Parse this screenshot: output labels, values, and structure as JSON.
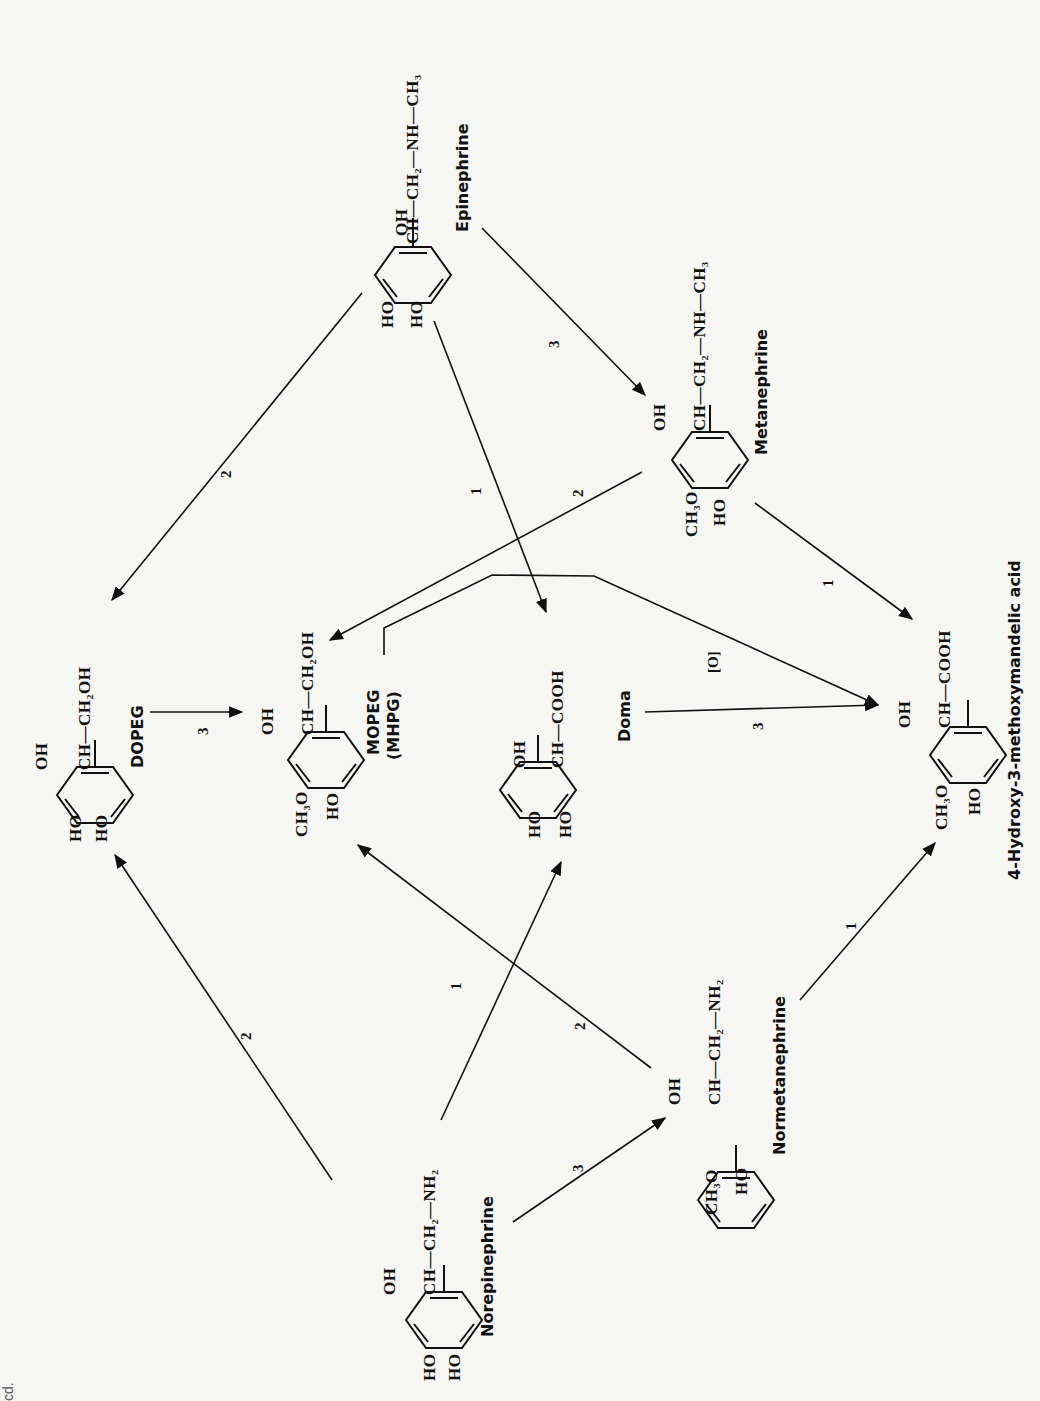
{
  "diagram": {
    "type": "metabolic-pathway",
    "orientation": "rotated-90-ccw",
    "compounds": {
      "epinephrine": {
        "name": "Epinephrine",
        "side_chain": "CH—CH₂—NH—CH₃",
        "oh": "OH",
        "ring_sub_1": "HO",
        "ring_sub_2": "HO"
      },
      "metanephrine": {
        "name": "Metanephrine",
        "side_chain": "CH—CH₂—NH—CH₃",
        "oh": "OH",
        "ring_sub_1": "CH₃O",
        "ring_sub_2": "HO"
      },
      "dopeg": {
        "name": "DOPEG",
        "side_chain": "CH—CH₂OH",
        "oh": "OH",
        "ring_sub_1": "HO",
        "ring_sub_2": "HO"
      },
      "mopeg": {
        "name": "MOPEG",
        "alt_name": "(MHPG)",
        "side_chain": "CH—CH₂OH",
        "oh": "OH",
        "ring_sub_1": "CH₃O",
        "ring_sub_2": "HO"
      },
      "doma": {
        "name": "Doma",
        "side_chain": "CH—COOH",
        "oh": "OH",
        "ring_sub_1": "HO",
        "ring_sub_2": "HO"
      },
      "vma": {
        "name": "4-Hydroxy-3-methoxymandelic acid",
        "side_chain": "CH—COOH",
        "oh": "OH",
        "ring_sub_1": "CH₃O",
        "ring_sub_2": "HO"
      },
      "norepinephrine": {
        "name": "Norepinephrine",
        "side_chain": "CH—CH₂—NH₂",
        "oh": "OH",
        "ring_sub_1": "HO",
        "ring_sub_2": "HO"
      },
      "normetanephrine": {
        "name": "Normetanephrine",
        "side_chain": "CH—CH₂—NH₂",
        "oh": "OH",
        "ring_sub_1": "CH₃O",
        "ring_sub_2": "HO"
      }
    },
    "reactions": [
      {
        "from": "Epinephrine",
        "to": "Metanephrine",
        "label": "3"
      },
      {
        "from": "Epinephrine",
        "to": "DOPEG",
        "label": "2"
      },
      {
        "from": "Epinephrine",
        "to": "Doma",
        "label": "1"
      },
      {
        "from": "Metanephrine",
        "to": "MOPEG",
        "label": "2"
      },
      {
        "from": "Metanephrine",
        "to": "4-Hydroxy-3-methoxymandelic acid",
        "label": "1"
      },
      {
        "from": "DOPEG",
        "to": "MOPEG",
        "label": "3"
      },
      {
        "from": "MOPEG",
        "to": "4-Hydroxy-3-methoxymandelic acid",
        "label": "[O]"
      },
      {
        "from": "Doma",
        "to": "4-Hydroxy-3-methoxymandelic acid",
        "label": "3"
      },
      {
        "from": "Norepinephrine",
        "to": "DOPEG",
        "label": "2"
      },
      {
        "from": "Norepinephrine",
        "to": "Doma",
        "label": "1"
      },
      {
        "from": "Norepinephrine",
        "to": "Normetanephrine",
        "label": "3"
      },
      {
        "from": "Normetanephrine",
        "to": "MOPEG",
        "label": "2"
      },
      {
        "from": "Normetanephrine",
        "to": "4-Hydroxy-3-methoxymandelic acid",
        "label": "1"
      }
    ],
    "labels": {
      "r_epi_met": "3",
      "r_epi_dopeg": "2",
      "r_epi_doma": "1",
      "r_met_mopeg": "2",
      "r_met_vma": "1",
      "r_dopeg_mopeg": "3",
      "r_mopeg_vma": "[O]",
      "r_doma_vma": "3",
      "r_ne_dopeg": "2",
      "r_ne_doma": "1",
      "r_ne_nmn": "3",
      "r_nmn_mopeg": "2",
      "r_nmn_vma": "1"
    },
    "corner_fragment": "cd."
  }
}
